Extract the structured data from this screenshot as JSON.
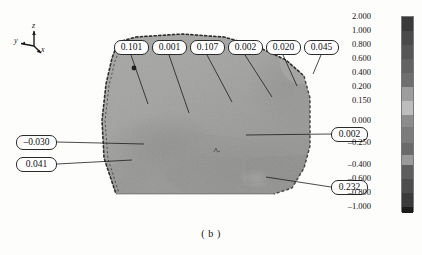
{
  "caption": "( b )",
  "axes": {
    "name": "coordinate-triad",
    "x_label": "x",
    "y_label": "y",
    "z_label": "z"
  },
  "top_callouts": [
    {
      "value": "0.101",
      "left": 114,
      "top": 40,
      "width": 35,
      "tip_x": 148,
      "tip_y": 104
    },
    {
      "value": "0.001",
      "left": 152,
      "top": 40,
      "width": 35,
      "tip_x": 189,
      "tip_y": 113
    },
    {
      "value": "0.107",
      "left": 190,
      "top": 40,
      "width": 35,
      "tip_x": 232,
      "tip_y": 102
    },
    {
      "value": "0.002",
      "left": 228,
      "top": 40,
      "width": 35,
      "tip_x": 272,
      "tip_y": 97
    },
    {
      "value": "0.020",
      "left": 266,
      "top": 40,
      "width": 35,
      "tip_x": 297,
      "tip_y": 86
    },
    {
      "value": "0.045",
      "left": 304,
      "top": 40,
      "width": 35,
      "tip_x": 313,
      "tip_y": 74
    }
  ],
  "left_callouts": [
    {
      "value": "–0.030",
      "left": 16,
      "top": 135,
      "width": 41,
      "tip_x": 144,
      "tip_y": 144
    },
    {
      "value": "0.041",
      "left": 16,
      "top": 157,
      "width": 41,
      "tip_x": 132,
      "tip_y": 160
    }
  ],
  "right_callouts": [
    {
      "value": "0.002",
      "left": 331,
      "top": 127,
      "width": 37,
      "tip_x": 246,
      "tip_y": 135
    },
    {
      "value": "0.232",
      "left": 331,
      "top": 180,
      "width": 37,
      "tip_x": 266,
      "tip_y": 177
    }
  ],
  "colorbar": {
    "name": "grayscale-contour-legend",
    "ticks": [
      {
        "label": "2.000",
        "y": 0
      },
      {
        "label": "1.000",
        "y": 14
      },
      {
        "label": "0.800",
        "y": 28
      },
      {
        "label": "0.600",
        "y": 42
      },
      {
        "label": "0.400",
        "y": 56
      },
      {
        "label": "0.200",
        "y": 70
      },
      {
        "label": "0.150",
        "y": 84
      },
      {
        "label": "0.000",
        "y": 104
      },
      {
        "label": "–0.250",
        "y": 126
      },
      {
        "label": "–0.400",
        "y": 148
      },
      {
        "label": "–0.600",
        "y": 162
      },
      {
        "label": "–0.800",
        "y": 176
      },
      {
        "label": "–1.000",
        "y": 190
      }
    ],
    "bands": [
      {
        "color": "#3a3a3a",
        "top": 0,
        "height": 14
      },
      {
        "color": "#4a4a4a",
        "top": 14,
        "height": 14
      },
      {
        "color": "#565656",
        "top": 28,
        "height": 14
      },
      {
        "color": "#626262",
        "top": 42,
        "height": 14
      },
      {
        "color": "#6e6e6e",
        "top": 56,
        "height": 14
      },
      {
        "color": "#9d9d9d",
        "top": 70,
        "height": 14
      },
      {
        "color": "#bdbdbd",
        "top": 84,
        "height": 14
      },
      {
        "color": "#8c8c8c",
        "top": 98,
        "height": 12
      },
      {
        "color": "#7b7b7b",
        "top": 110,
        "height": 16
      },
      {
        "color": "#6a6a6a",
        "top": 126,
        "height": 12
      },
      {
        "color": "#9a9a9a",
        "top": 138,
        "height": 10
      },
      {
        "color": "#5e5e5e",
        "top": 148,
        "height": 14
      },
      {
        "color": "#4d4d4d",
        "top": 162,
        "height": 14
      },
      {
        "color": "#3b3b3b",
        "top": 176,
        "height": 14
      },
      {
        "color": "#1c1c1c",
        "top": 190,
        "height": 6
      }
    ]
  },
  "specimen": {
    "name": "strain-contour-specimen",
    "fill_base": "#a0a09e",
    "edge_color": "#2a2a28"
  }
}
